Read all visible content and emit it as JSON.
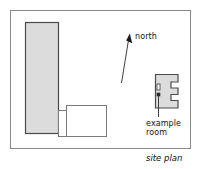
{
  "figure": {
    "caption": "site plan",
    "frame": {
      "x": 10,
      "y": 10,
      "width": 181,
      "height": 139,
      "border_color": "#8a8a8a"
    }
  },
  "annotations": {
    "north_label": "north",
    "example_room_label_line1": "example",
    "example_room_label_line2": "room",
    "north_arrow": {
      "name": "north-arrow",
      "from_x": 122,
      "from_y": 83,
      "to_x": 128,
      "to_y": 36
    },
    "leader_line": {
      "name": "example-room-leader",
      "from_x": 158,
      "from_y": 97,
      "to_x": 158,
      "to_y": 117
    }
  },
  "colors": {
    "building_fill": "#dcdcdc",
    "building_stroke": "#4a4a4a",
    "white_wing_fill": "#ffffff",
    "white_wing_stroke": "#7a7a7a",
    "frame_stroke": "#8a8a8a",
    "text": "#111111",
    "marker": "#2a2a2a"
  },
  "shapes": {
    "main_building": {
      "name": "main-building-block",
      "description": "tall gray rectangle, left side of site",
      "x": 25,
      "y": 22,
      "width": 33,
      "height": 111
    },
    "connector_wing": {
      "name": "connector-wing",
      "description": "narrow white link between main block and south wing",
      "x": 58,
      "y": 110,
      "width": 9,
      "height": 27
    },
    "south_wing": {
      "name": "south-wing",
      "description": "white rectangular wing to the south-east of the main block",
      "x": 66,
      "y": 105,
      "width": 41,
      "height": 32
    },
    "example_room": {
      "name": "example-room-block",
      "description": "gray notched block at right, the highlighted example room",
      "points": "155,74 178,74 178,82 171,82 171,88 178,88 178,94 171,94 171,100 178,100 178,108 155,108",
      "door_marker": {
        "x": 157,
        "y": 84,
        "width": 3,
        "height": 6
      },
      "dot_marker": {
        "x": 157,
        "y": 93,
        "width": 3,
        "height": 3
      }
    }
  }
}
